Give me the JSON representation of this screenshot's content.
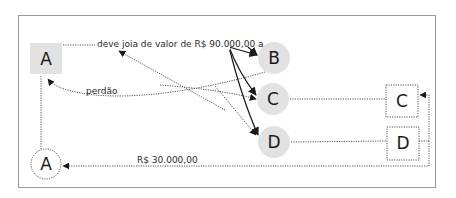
{
  "diagram": {
    "title": "",
    "colors": {
      "frame": "#9a9a9a",
      "node_fill": "#e2e2e2",
      "dotted_line": "#555555",
      "solid_arrow": "#1a1a1a"
    },
    "nodes": {
      "a_square": {
        "label": "A",
        "shape": "square",
        "style": "gray-fill"
      },
      "b_circle": {
        "label": "B",
        "shape": "circle",
        "style": "gray-fill"
      },
      "c_circle": {
        "label": "C",
        "shape": "circle",
        "style": "gray-fill"
      },
      "d_circle": {
        "label": "D",
        "shape": "circle",
        "style": "gray-fill"
      },
      "c_box": {
        "label": "C",
        "shape": "square",
        "style": "dotted-outline"
      },
      "d_box": {
        "label": "D",
        "shape": "square",
        "style": "dotted-outline"
      },
      "a_circle": {
        "label": "A",
        "shape": "circle",
        "style": "dotted-outline"
      }
    },
    "edge_labels": {
      "debt": "deve joia de valor de R$ 90.000,00 a",
      "pardon": "perdão",
      "payment": "R$ 30.000,00"
    },
    "edges": [
      {
        "from": "a_square",
        "to": "debt_label",
        "style": "dotted"
      },
      {
        "from": "debt_label",
        "to": "b_circle",
        "style": "solid-arrow"
      },
      {
        "from": "debt_label",
        "to": "c_circle",
        "style": "solid-arrow"
      },
      {
        "from": "debt_label",
        "to": "d_circle",
        "style": "solid-arrow"
      },
      {
        "from": "b_circle",
        "to": "a_square",
        "style": "dotted-arrow",
        "label": "perdão"
      },
      {
        "from": "a_square",
        "to": "c_circle",
        "style": "dotted-arrow"
      },
      {
        "from": "d_circle",
        "to": "debt_label",
        "style": "dotted-arrow"
      },
      {
        "from": "debt_label",
        "to": "d_circle",
        "style": "dotted-arrow"
      },
      {
        "from": "c_circle",
        "to": "c_box",
        "style": "dotted"
      },
      {
        "from": "d_circle",
        "to": "d_box",
        "style": "dotted"
      },
      {
        "from": "d_box",
        "to": "c_box",
        "style": "dotted-arrow"
      },
      {
        "from": "d_box",
        "to": "a_circle",
        "style": "dotted-arrow",
        "label": "R$ 30.000,00"
      },
      {
        "from": "a_square",
        "to": "a_circle",
        "style": "dotted"
      }
    ]
  }
}
